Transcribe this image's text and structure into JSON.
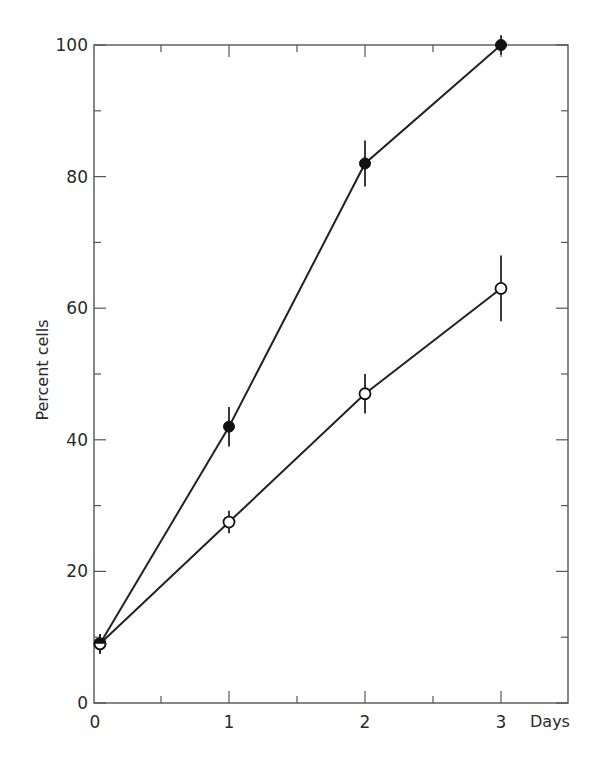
{
  "chart_data": {
    "type": "line",
    "title": "",
    "xlabel": "Days",
    "ylabel": "Percent cells",
    "x": [
      0,
      1,
      2,
      3
    ],
    "xlim": [
      0,
      3.5
    ],
    "ylim": [
      0,
      100
    ],
    "xticks": [
      0,
      1,
      2,
      3
    ],
    "xtick_labels": [
      "0",
      "1",
      "2",
      "3"
    ],
    "x_minor_ticks": [
      0.5,
      1.5,
      2.5
    ],
    "yticks": [
      0,
      20,
      40,
      60,
      80,
      100
    ],
    "ytick_labels": [
      "0",
      "20",
      "40",
      "60",
      "80",
      "100"
    ],
    "y_minor_ticks": [
      10,
      30,
      50,
      70,
      90
    ],
    "grid": false,
    "legend": null,
    "series": [
      {
        "name": "filled circles",
        "marker": "filled-circle",
        "values": [
          9,
          42,
          82,
          100
        ],
        "errors": [
          1.5,
          3,
          3.5,
          1.5
        ]
      },
      {
        "name": "open circles",
        "marker": "open-circle",
        "values": [
          9,
          27.5,
          47,
          63
        ],
        "errors": [
          1.5,
          1.7,
          3,
          5
        ]
      }
    ]
  }
}
